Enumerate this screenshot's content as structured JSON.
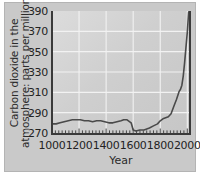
{
  "chart_data": {
    "type": "line",
    "title": "",
    "xlabel": "Year",
    "ylabel_lines": [
      "Carbon dioxide in the",
      "atmosphere: parts per million"
    ],
    "ylabel": "Carbon dioxide in the atmosphere: parts per million",
    "xlim": [
      1000,
      2020
    ],
    "ylim": [
      270,
      390
    ],
    "xticks": [
      1000,
      1200,
      1400,
      1600,
      1800,
      2000
    ],
    "xtick_labels": [
      "1000",
      "1200",
      "1400",
      "1600",
      "1800",
      "2000"
    ],
    "yticks": [
      270,
      290,
      310,
      330,
      350,
      370,
      390
    ],
    "ytick_labels": [
      "270",
      "290",
      "310",
      "330",
      "350",
      "370",
      "390"
    ],
    "x_minor_tick_interval": 25,
    "grid": true,
    "grid_color": "#f2f2f2",
    "legend": null,
    "line_color": "#4a4a4a",
    "plot_background": "#d2d2d2",
    "series": [
      {
        "name": "Atmospheric CO2",
        "x": [
          1000,
          1030,
          1060,
          1090,
          1120,
          1150,
          1180,
          1210,
          1240,
          1270,
          1300,
          1330,
          1360,
          1390,
          1420,
          1450,
          1480,
          1510,
          1530,
          1545,
          1555,
          1565,
          1575,
          1585,
          1600,
          1620,
          1650,
          1680,
          1700,
          1720,
          1750,
          1780,
          1800,
          1820,
          1840,
          1860,
          1880,
          1900,
          1920,
          1940,
          1950,
          1960,
          1970,
          1980,
          1990,
          2000,
          2010,
          2018
        ],
        "values": [
          279,
          279,
          280,
          281,
          282,
          283,
          283,
          283,
          282,
          282,
          281,
          282,
          282,
          281,
          280,
          280,
          281,
          282,
          283,
          283,
          283,
          282,
          281,
          280,
          273,
          272,
          273,
          273,
          274,
          275,
          277,
          279,
          282,
          284,
          285,
          286,
          289,
          296,
          303,
          311,
          313,
          317,
          326,
          339,
          354,
          369,
          389,
          390
        ]
      }
    ]
  }
}
